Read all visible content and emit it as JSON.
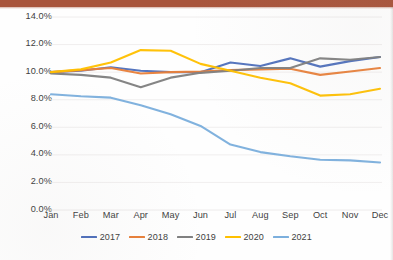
{
  "chart_data": {
    "type": "line",
    "title": "",
    "subtitle": "",
    "xlabel": "",
    "ylabel": "",
    "categories": [
      "Jan",
      "Feb",
      "Mar",
      "Apr",
      "May",
      "Jun",
      "Jul",
      "Aug",
      "Sep",
      "Oct",
      "Nov",
      "Dec"
    ],
    "ylim": [
      0.0,
      14.0
    ],
    "ytick_labels": [
      "0.0%",
      "2.0%",
      "4.0%",
      "6.0%",
      "8.0%",
      "10.0%",
      "12.0%",
      "14.0%"
    ],
    "ytick_values": [
      0.0,
      2.0,
      4.0,
      6.0,
      8.0,
      10.0,
      12.0,
      14.0
    ],
    "yunit": "%",
    "grid": "horizontal-faint",
    "legend_position": "bottom-center",
    "series": [
      {
        "name": "2017",
        "color": "#4e6fbb",
        "values": [
          10.0,
          10.1,
          10.35,
          10.1,
          10.0,
          10.0,
          10.7,
          10.45,
          11.0,
          10.4,
          10.8,
          11.1
        ]
      },
      {
        "name": "2018",
        "color": "#e8803a",
        "values": [
          10.0,
          10.15,
          10.3,
          9.9,
          10.0,
          10.05,
          10.15,
          10.2,
          10.25,
          9.8,
          10.05,
          10.3
        ]
      },
      {
        "name": "2019",
        "color": "#808080",
        "values": [
          9.9,
          9.8,
          9.6,
          8.9,
          9.6,
          9.95,
          10.1,
          10.3,
          10.3,
          11.0,
          10.9,
          11.1
        ]
      },
      {
        "name": "2020",
        "color": "#ffc000",
        "values": [
          10.0,
          10.2,
          10.7,
          11.6,
          11.55,
          10.6,
          10.1,
          9.6,
          9.2,
          8.3,
          8.4,
          8.8
        ]
      },
      {
        "name": "2021",
        "color": "#7cafdd",
        "values": [
          8.4,
          8.25,
          8.15,
          7.6,
          6.95,
          6.1,
          4.75,
          4.2,
          3.9,
          3.65,
          3.6,
          3.45
        ]
      }
    ],
    "legend_entries": [
      "2017",
      "2018",
      "2019",
      "2020",
      "2021"
    ]
  },
  "decor": {
    "top_bar_color": "#a9553c"
  }
}
